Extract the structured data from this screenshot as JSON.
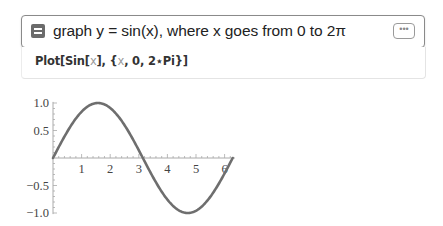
{
  "input": {
    "icon": "natural-language-input-icon",
    "query": "graph y = sin(x), where x goes from 0 to 2π",
    "more_button_label": "•••"
  },
  "code": {
    "prefix": "Plot[Sin[",
    "var1": "x",
    "middle": "], {",
    "var2": "x",
    "suffix": ", 0, 2⋆Pi}]"
  },
  "chart_data": {
    "type": "line",
    "title": "",
    "function": "sin(x)",
    "xlabel": "",
    "ylabel": "",
    "xlim": [
      0,
      6.2832
    ],
    "ylim": [
      -1.0,
      1.0
    ],
    "x_ticks": [
      "1",
      "2",
      "3",
      "4",
      "5",
      "6"
    ],
    "y_ticks": [
      "1.0",
      "0.5",
      "−0.5",
      "−1.0"
    ],
    "grid": false,
    "legend": null,
    "series": [
      {
        "name": "sin(x)",
        "color": "#6e6e6e",
        "x": [
          0,
          0.5236,
          1.0472,
          1.5708,
          2.0944,
          2.618,
          3.1416,
          3.6652,
          4.1888,
          4.7124,
          5.236,
          5.7596,
          6.2832
        ],
        "y": [
          0,
          0.5,
          0.866,
          1.0,
          0.866,
          0.5,
          0,
          -0.5,
          -0.866,
          -1.0,
          -0.866,
          -0.5,
          0
        ]
      }
    ]
  }
}
